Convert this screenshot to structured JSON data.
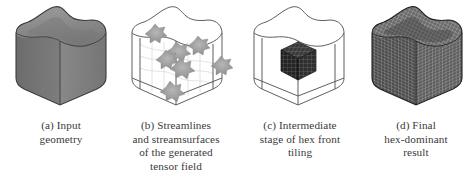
{
  "figure": {
    "background_color": "#ffffff",
    "panel_count": 4
  },
  "panels": [
    {
      "id": "a",
      "name": "input-geometry",
      "render_style": "solid-shaded-surface",
      "description": "Solid shaded cube with rounded vertical edges and a wavy saddle-shaped top surface",
      "fill_color": "#808080",
      "top_face_color": "#8e8e8e",
      "left_face_color": "#767676",
      "right_face_color": "#8a8a8a",
      "edge_color": "#3c3c3c",
      "caption_lines": [
        "(a) Input",
        "geometry"
      ]
    },
    {
      "id": "b",
      "name": "streamlines-and-streamsurfaces",
      "render_style": "wireframe-with-blobs",
      "description": "Wireframe outline of the geometry containing gray star-shaped streamsurface patches and faint streamlines",
      "wire_color": "#555555",
      "blob_color": "#9a9a9a",
      "blob_count": 7,
      "caption_lines": [
        "(b) Streamlines",
        "and streamsurfaces",
        "of the generated",
        "tensor field"
      ]
    },
    {
      "id": "c",
      "name": "intermediate-hex-front-tiling",
      "render_style": "wireframe-with-hex-cube",
      "description": "Wireframe outline of the geometry with a small dark hexahedral mesh cube tiled at the center",
      "wire_color": "#555555",
      "hex_cube_color": "#2e2e2e",
      "hex_cube_grid_color": "#777777",
      "caption_lines": [
        "(c) Intermediate",
        "stage of hex front",
        "tiling"
      ]
    },
    {
      "id": "d",
      "name": "final-hex-dominant-result",
      "render_style": "dense-hex-mesh-solid",
      "description": "The full geometry filled and covered with a dense hex-dominant mesh grid",
      "fill_color": "#5a5a5a",
      "mesh_line_color": "#cfcfcf",
      "edge_color": "#202020",
      "caption_lines": [
        "(d) Final",
        "hex-dominant",
        "result"
      ]
    }
  ]
}
